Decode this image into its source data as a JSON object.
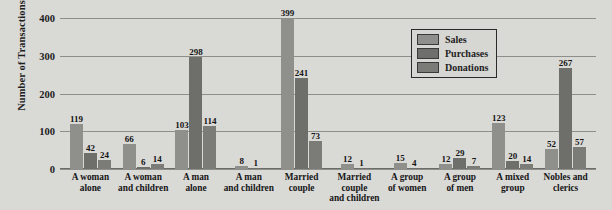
{
  "chart_data": {
    "type": "bar",
    "title": "",
    "subtitle": "",
    "xlabel": "",
    "ylabel": "Number of Transactions",
    "ylim": [
      0,
      400
    ],
    "yticks": [
      0,
      100,
      200,
      300,
      400
    ],
    "grid": true,
    "legend_position": "inside-top-right",
    "categories": [
      "A woman\nalone",
      "A woman\nand children",
      "A man\nalone",
      "A man\nand children",
      "Married\ncouple",
      "Married\ncouple\nand children",
      "A group\nof women",
      "A group\nof men",
      "A mixed\ngroup",
      "Nobles and\nclerics"
    ],
    "series": [
      {
        "name": "Sales",
        "color": "#8f8f8b",
        "values": [
          119,
          66,
          103,
          8,
          399,
          12,
          15,
          12,
          123,
          52
        ]
      },
      {
        "name": "Purchases",
        "color": "#6e6e6a",
        "values": [
          42,
          6,
          298,
          1,
          241,
          1,
          4,
          29,
          20,
          267
        ]
      },
      {
        "name": "Donations",
        "color": "#7b7b77",
        "values": [
          24,
          14,
          114,
          null,
          73,
          null,
          null,
          7,
          14,
          57
        ]
      }
    ]
  },
  "legend": {
    "items": [
      {
        "label": "Sales"
      },
      {
        "label": "Purchases"
      },
      {
        "label": "Donations"
      }
    ]
  }
}
